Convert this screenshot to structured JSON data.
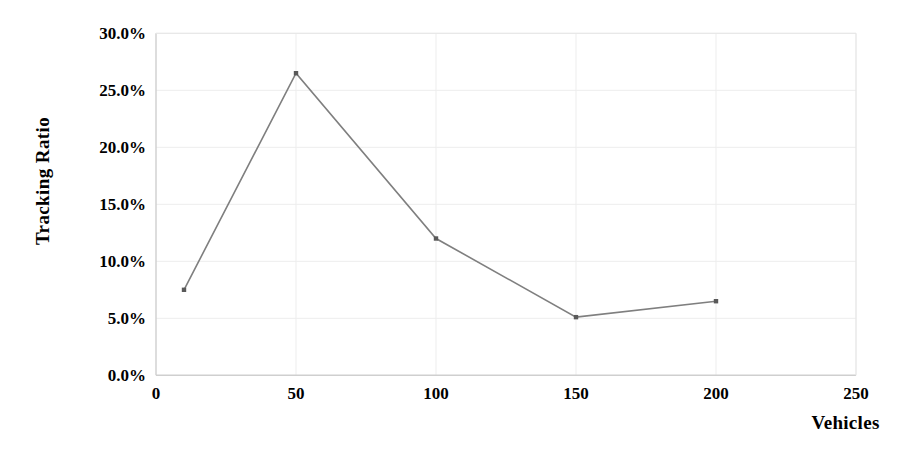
{
  "chart_data": {
    "type": "line",
    "title": "",
    "xlabel": "Vehicles",
    "ylabel": "Tracking Ratio",
    "x": [
      10,
      50,
      100,
      150,
      200
    ],
    "values": [
      7.5,
      26.5,
      12.0,
      5.1,
      6.5
    ],
    "series": [
      {
        "name": "Tracking Ratio",
        "values": [
          7.5,
          26.5,
          12.0,
          5.1,
          6.5
        ]
      }
    ],
    "xlim": [
      0,
      250
    ],
    "ylim": [
      0,
      30
    ],
    "xticks": [
      "0",
      "50",
      "100",
      "150",
      "200",
      "250"
    ],
    "xtick_values": [
      0,
      50,
      100,
      150,
      200,
      250
    ],
    "yticks": [
      "0.0%",
      "5.0%",
      "10.0%",
      "15.0%",
      "20.0%",
      "25.0%",
      "30.0%"
    ],
    "ytick_values": [
      0,
      5,
      10,
      15,
      20,
      25,
      30
    ],
    "grid": "faint-light-gray",
    "legend": "none",
    "line_color": "#7f7f7f",
    "marker": "square",
    "marker_color": "#595959",
    "axis_color": "#d9d9d9",
    "text_color": "#000000",
    "background": "#ffffff"
  },
  "axis": {
    "y_title": "Tracking Ratio",
    "x_title": "Vehicles"
  }
}
